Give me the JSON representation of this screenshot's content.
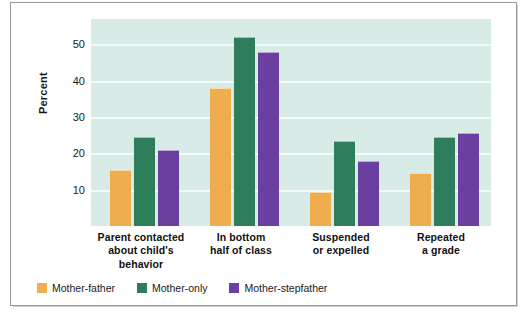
{
  "chart_data": {
    "type": "bar",
    "title": "",
    "subtitle": "",
    "xlabel": "",
    "ylabel": "Percent",
    "ylim": [
      0,
      57
    ],
    "yticks": [
      10,
      20,
      30,
      40,
      50
    ],
    "ytick_labels": [
      "10",
      "20",
      "30",
      "40",
      "50"
    ],
    "grid": true,
    "grid_axis": "y",
    "legend_position": "bottom-left",
    "categories": [
      "Parent contacted about child's behavior",
      "In bottom half of class",
      "Suspended or expelled",
      "Repeated a grade"
    ],
    "category_lines": [
      [
        "Parent contacted",
        "about child's",
        "behavior"
      ],
      [
        "In bottom",
        "half of class"
      ],
      [
        "Suspended",
        "or expelled"
      ],
      [
        "Repeated",
        "a grade"
      ]
    ],
    "series": [
      {
        "name": "Mother-father",
        "color": "#f0ad4e",
        "values": [
          15.5,
          38.0,
          9.5,
          14.5
        ]
      },
      {
        "name": "Mother-only",
        "color": "#2e7d5b",
        "values": [
          24.5,
          52.0,
          23.5,
          24.5
        ]
      },
      {
        "name": "Mother-stepfather",
        "color": "#6b3fa0",
        "values": [
          21.0,
          48.0,
          18.0,
          25.5
        ]
      }
    ]
  },
  "colors": {
    "plot_background": "#d9ebe7",
    "gridline": "#f4fbf9",
    "frame_border": "#9a9a9a",
    "page_background": "#ffffff",
    "text": "#151515",
    "series_mother_father": "#f0ad4e",
    "series_mother_only": "#2e7d5b",
    "series_mother_stepfather": "#6b3fa0"
  }
}
